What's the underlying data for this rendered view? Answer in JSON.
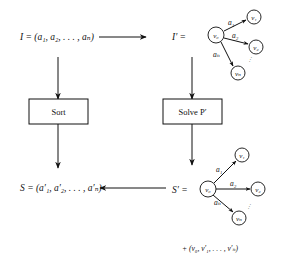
{
  "diagram": {
    "input": {
      "label": "I = (a₁, a₂, . . . , aₙ)"
    },
    "transformed_input": {
      "label": "I′ =",
      "graph": {
        "source": "v₀",
        "targets": [
          "v₁",
          "v₂",
          "vₙ"
        ],
        "edges": [
          "a₁",
          "a₂",
          "aₙ"
        ],
        "ellipsis": "···"
      }
    },
    "sort_box": {
      "label": "Sort"
    },
    "solve_box": {
      "label": "Solve P′"
    },
    "output": {
      "label": "S = (a′₁, a′₂, . . . , a′ₙ)"
    },
    "solution": {
      "label": "S′ =",
      "graph": {
        "source": "v₀",
        "targets": [
          "v₁",
          "v₂",
          "vₙ"
        ],
        "edges": [
          "a₁",
          "a₂",
          "aₙ"
        ],
        "ellipsis": "···"
      },
      "path": "+ (v₀, v′₁, . . . , v′ₙ)"
    }
  }
}
